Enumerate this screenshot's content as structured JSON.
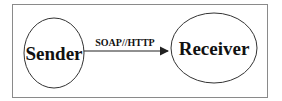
{
  "diagram": {
    "nodes": [
      {
        "id": "sender",
        "label": "Sender"
      },
      {
        "id": "receiver",
        "label": "Receiver"
      }
    ],
    "edges": [
      {
        "from": "sender",
        "to": "receiver",
        "label": "SOAP//HTTP"
      }
    ]
  },
  "colors": {
    "stroke": "#333333",
    "frame": "#888888",
    "text": "#111111",
    "background": "#ffffff"
  }
}
